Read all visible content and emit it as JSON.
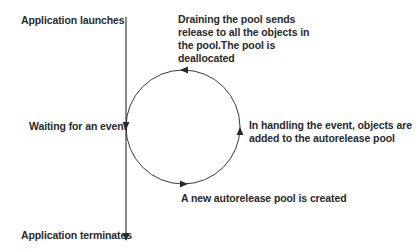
{
  "diagram": {
    "timeline": {
      "start_label": "Application launches",
      "middle_label": "Waiting for an event",
      "end_label": "Application terminates"
    },
    "cycle": {
      "top_label": "Draining the pool sends release to all the objects in the pool.The pool is deallocated",
      "top_label_lines": [
        "Draining the pool sends",
        "release to all the objects in",
        "the pool.The pool is",
        "deallocated"
      ],
      "right_label_lines": [
        "In handling the event, objects are",
        "added to the autorelease pool"
      ],
      "bottom_label": "A new autorelease pool is created",
      "direction": "counterclockwise"
    },
    "colors": {
      "line": "#3a3a3a",
      "text": "#2a2a2a",
      "background": "#ffffff"
    }
  }
}
